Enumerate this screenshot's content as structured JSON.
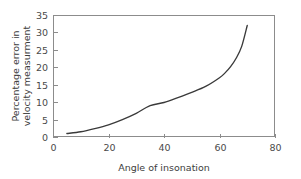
{
  "chart_data": {
    "type": "line",
    "title": "",
    "subtitle": "",
    "xlabel": "Angle of insonation",
    "ylabel": "Percentage error in velocity measurment",
    "ylabel_line1": "Percentage error in",
    "ylabel_line2": "velocity measurment",
    "xlim": [
      0,
      80
    ],
    "ylim": [
      0,
      35
    ],
    "xticks": [
      0,
      20,
      40,
      60,
      80
    ],
    "yticks": [
      0,
      5,
      10,
      15,
      20,
      25,
      30,
      35
    ],
    "xtick_labels": [
      "0",
      "20",
      "40",
      "60",
      "80"
    ],
    "ytick_labels": [
      "0",
      "5",
      "10",
      "15",
      "20",
      "25",
      "30",
      "35"
    ],
    "grid": false,
    "legend": false,
    "legend_position": "none",
    "series": [
      {
        "name": "Cosine error",
        "x": [
          5,
          10,
          15,
          20,
          25,
          30,
          35,
          40,
          45,
          50,
          55,
          60,
          62,
          64,
          66,
          68,
          70
        ],
        "values": [
          1.0,
          1.5,
          2.4,
          3.5,
          5.0,
          6.8,
          9.0,
          9.9,
          11.3,
          12.8,
          14.5,
          17.0,
          18.4,
          20.2,
          22.6,
          26.0,
          32.0
        ]
      }
    ],
    "colors": {
      "curve": "#3a3a3a",
      "axis": "#8c8c8c",
      "tick_label": "#4a4a4a",
      "axis_title": "#3d3d3d",
      "background": "#ffffff"
    },
    "geometry": {
      "plot_left": 53,
      "plot_right": 275,
      "plot_top": 15,
      "plot_bottom": 137
    }
  }
}
